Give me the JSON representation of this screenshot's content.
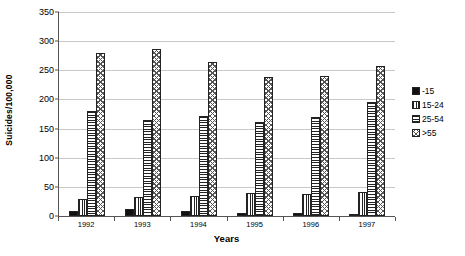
{
  "chart_data": {
    "type": "bar",
    "title": "",
    "xlabel": "Years",
    "ylabel": "Suicides/100,000",
    "categories": [
      "1992",
      "1993",
      "1994",
      "1995",
      "1996",
      "1997"
    ],
    "ylim": [
      0,
      350
    ],
    "yticks": [
      0,
      50,
      100,
      150,
      200,
      250,
      300,
      350
    ],
    "ytick_labels": [
      "0",
      "50",
      "100",
      "150",
      "200",
      "250",
      "300",
      "350"
    ],
    "grid": true,
    "legend_position": "right",
    "series": [
      {
        "name": "-15",
        "pattern": "solid",
        "values": [
          8,
          12,
          8,
          6,
          6,
          3
        ]
      },
      {
        "name": "15-24",
        "pattern": "vertical",
        "values": [
          30,
          33,
          35,
          39,
          37,
          42
        ]
      },
      {
        "name": "25-54",
        "pattern": "horizontal",
        "values": [
          181,
          165,
          171,
          161,
          170,
          196
        ]
      },
      {
        "name": ">55",
        "pattern": "crosshatch",
        "values": [
          279,
          286,
          264,
          238,
          240,
          258
        ]
      }
    ]
  }
}
